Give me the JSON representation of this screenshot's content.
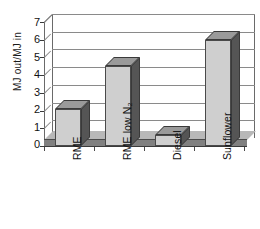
{
  "chart_data": {
    "type": "bar",
    "title": "",
    "subtitle": "",
    "xlabel": "",
    "ylabel": "MJ out/MJ in",
    "categories": [
      "RME",
      "RME low N2",
      "Diesel",
      "Sunflower"
    ],
    "category_labels_html": [
      "RME",
      "RME low N₂",
      "Diesel",
      "Sunflower"
    ],
    "values": [
      2.1,
      4.5,
      0.6,
      6.0
    ],
    "ylim": [
      0,
      7
    ],
    "ytick_labels": [
      "0",
      "1",
      "2",
      "3",
      "4",
      "5",
      "6",
      "7"
    ],
    "ytick_values": [
      0,
      1,
      2,
      3,
      4,
      5,
      6,
      7
    ],
    "grid": true,
    "grid_axis": "y",
    "legend": false,
    "legend_position": "none",
    "style": "3d-column",
    "colors": {
      "bar_face": "#cfcfcf",
      "bar_side": "#555555",
      "bar_top": "#9a9a9a",
      "axis": "#3a3a3a",
      "gridline": "#8a8a8a",
      "floor": "#808080",
      "background": "#ffffff",
      "text": "#111111"
    }
  },
  "axes": {
    "y_title": "MJ out/MJ in"
  }
}
